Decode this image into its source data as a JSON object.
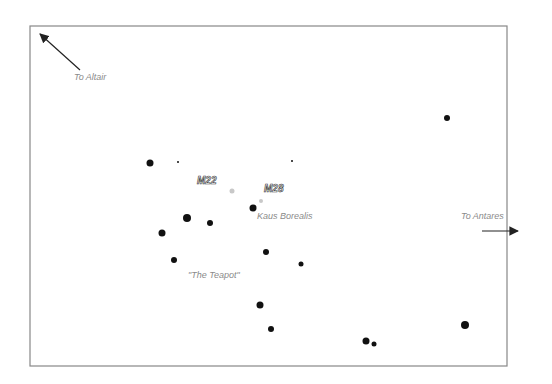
{
  "chart": {
    "frame": {
      "x": 30,
      "y": 26,
      "width": 477,
      "height": 340,
      "stroke": "#888888"
    },
    "colors": {
      "star": "#111111",
      "cluster": "#c8c8c8",
      "label": "#8a8a8a",
      "arrow": "#222222"
    }
  },
  "labels": {
    "to_altair": "To Altair",
    "to_antares": "To Antares",
    "m22": "M22",
    "m28": "M28",
    "kaus_borealis": "Kaus Borealis",
    "teapot": "\"The Teapot\""
  },
  "arrows": [
    {
      "name": "to-altair-arrow",
      "x1": 80,
      "y1": 70,
      "x2": 40,
      "y2": 34
    },
    {
      "name": "to-antares-arrow",
      "x1": 482,
      "y1": 231,
      "x2": 518,
      "y2": 231
    }
  ],
  "stars": [
    {
      "x": 150,
      "y": 163,
      "r": 3.5
    },
    {
      "x": 178,
      "y": 162,
      "r": 1
    },
    {
      "x": 292,
      "y": 161,
      "r": 1
    },
    {
      "x": 447,
      "y": 118,
      "r": 3
    },
    {
      "x": 253,
      "y": 208,
      "r": 3.5
    },
    {
      "x": 187,
      "y": 218,
      "r": 4
    },
    {
      "x": 210,
      "y": 223,
      "r": 3
    },
    {
      "x": 162,
      "y": 233,
      "r": 3.5
    },
    {
      "x": 174,
      "y": 260,
      "r": 3
    },
    {
      "x": 266,
      "y": 252,
      "r": 3
    },
    {
      "x": 301,
      "y": 264,
      "r": 2.5
    },
    {
      "x": 260,
      "y": 305,
      "r": 3.5
    },
    {
      "x": 271,
      "y": 329,
      "r": 3
    },
    {
      "x": 366,
      "y": 341,
      "r": 3.5
    },
    {
      "x": 374,
      "y": 344,
      "r": 2.5
    },
    {
      "x": 465,
      "y": 325,
      "r": 4
    }
  ],
  "clusters": [
    {
      "name": "M22",
      "x": 232,
      "y": 191,
      "r": 2.5
    },
    {
      "name": "M28",
      "x": 261,
      "y": 201,
      "r": 2
    }
  ]
}
